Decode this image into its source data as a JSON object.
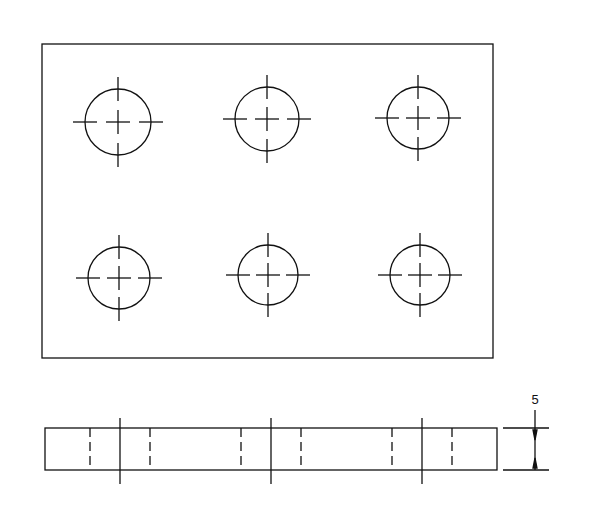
{
  "drawing": {
    "type": "technical-drawing",
    "views": [
      "top-view",
      "side-view"
    ],
    "top_view": {
      "outline": {
        "x1": 42,
        "y1": 44,
        "x2": 493,
        "y2": 358
      },
      "holes": [
        {
          "cx": 118,
          "cy": 122,
          "r": 33
        },
        {
          "cx": 267,
          "cy": 119,
          "r": 32
        },
        {
          "cx": 418,
          "cy": 118,
          "r": 31
        },
        {
          "cx": 119,
          "cy": 278,
          "r": 31
        },
        {
          "cx": 268,
          "cy": 275,
          "r": 30
        },
        {
          "cx": 420,
          "cy": 275,
          "r": 30
        }
      ]
    },
    "side_view": {
      "outline": {
        "x": 45,
        "y": 428,
        "w": 452,
        "h": 42
      },
      "hole_centers_x": [
        120,
        271,
        422
      ],
      "hidden_line_offset": 30
    },
    "dimension": {
      "label": "5",
      "x": 535,
      "y_top": 428,
      "y_bottom": 470
    }
  }
}
